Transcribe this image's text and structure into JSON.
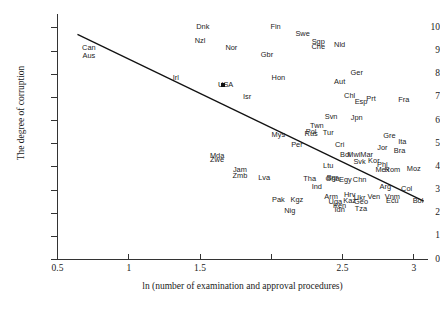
{
  "chart_data": {
    "type": "scatter",
    "title": "",
    "xlabel": "ln (number of examination and approval procedures)",
    "ylabel": "The degree of corruption",
    "xlim": [
      0.5,
      3.1
    ],
    "ylim": [
      0,
      10.6
    ],
    "xticks": [
      0.5,
      1,
      1.5,
      2,
      2.5,
      3
    ],
    "xticklabels": [
      "0.5",
      "1",
      "1.5",
      "",
      "2.5",
      "3"
    ],
    "yticks": [
      0,
      1,
      2,
      3,
      4,
      5,
      6,
      7,
      8,
      9,
      10
    ],
    "yticklabels": [
      "0",
      "1",
      "2",
      "3",
      "4",
      "5",
      "6",
      "7",
      "8",
      "9",
      "10"
    ],
    "grid": false,
    "legend": false,
    "trendline": {
      "x0": 0.64,
      "y0": 9.72,
      "x1": 3.07,
      "y1": 2.52
    },
    "points": [
      {
        "label": "Can",
        "x": 0.72,
        "y": 9.15
      },
      {
        "label": "Aus",
        "x": 0.72,
        "y": 8.78
      },
      {
        "label": "Dnk",
        "x": 1.52,
        "y": 10.02
      },
      {
        "label": "Nzl",
        "x": 1.5,
        "y": 9.45
      },
      {
        "label": "Fin",
        "x": 2.03,
        "y": 10.05
      },
      {
        "label": "Swe",
        "x": 2.22,
        "y": 9.72
      },
      {
        "label": "Nor",
        "x": 1.72,
        "y": 9.12
      },
      {
        "label": "Gbr",
        "x": 1.97,
        "y": 8.85
      },
      {
        "label": "Sgp",
        "x": 2.33,
        "y": 9.38
      },
      {
        "label": "Che",
        "x": 2.33,
        "y": 9.18
      },
      {
        "label": "Nld",
        "x": 2.48,
        "y": 9.28
      },
      {
        "label": "Irl",
        "x": 1.33,
        "y": 7.83
      },
      {
        "label": "USA",
        "x": 1.68,
        "y": 7.55
      },
      {
        "label": "Hon",
        "x": 2.05,
        "y": 7.85
      },
      {
        "label": "Ger",
        "x": 2.6,
        "y": 8.05
      },
      {
        "label": "Aut",
        "x": 2.48,
        "y": 7.65
      },
      {
        "label": "Isr",
        "x": 1.83,
        "y": 7.02
      },
      {
        "label": "Chl",
        "x": 2.55,
        "y": 7.05
      },
      {
        "label": "Esp",
        "x": 2.63,
        "y": 6.82
      },
      {
        "label": "Prt",
        "x": 2.7,
        "y": 6.92
      },
      {
        "label": "Fra",
        "x": 2.93,
        "y": 6.88
      },
      {
        "label": "Svn",
        "x": 2.42,
        "y": 6.15
      },
      {
        "label": "Jpn",
        "x": 2.6,
        "y": 6.12
      },
      {
        "label": "Twn",
        "x": 2.32,
        "y": 5.78
      },
      {
        "label": "Pol",
        "x": 2.28,
        "y": 5.52
      },
      {
        "label": "Rus",
        "x": 2.28,
        "y": 5.42
      },
      {
        "label": "Tur",
        "x": 2.4,
        "y": 5.48
      },
      {
        "label": "Mys",
        "x": 2.05,
        "y": 5.38
      },
      {
        "label": "Gre",
        "x": 2.83,
        "y": 5.32
      },
      {
        "label": "Ita",
        "x": 2.92,
        "y": 5.08
      },
      {
        "label": "Per",
        "x": 2.18,
        "y": 4.95
      },
      {
        "label": "Cri",
        "x": 2.48,
        "y": 4.95
      },
      {
        "label": "Jor",
        "x": 2.78,
        "y": 4.82
      },
      {
        "label": "Bra",
        "x": 2.9,
        "y": 4.68
      },
      {
        "label": "Mda",
        "x": 1.62,
        "y": 4.48
      },
      {
        "label": "Zwe",
        "x": 1.62,
        "y": 4.3
      },
      {
        "label": "Mwi",
        "x": 2.58,
        "y": 4.52
      },
      {
        "label": "Mar",
        "x": 2.67,
        "y": 4.52
      },
      {
        "label": "Bol",
        "x": 2.52,
        "y": 4.52
      },
      {
        "label": "Svk",
        "x": 2.62,
        "y": 4.22
      },
      {
        "label": "Kor",
        "x": 2.72,
        "y": 4.25
      },
      {
        "label": "Phl",
        "x": 2.78,
        "y": 4.08
      },
      {
        "label": "Ltu",
        "x": 2.4,
        "y": 4.05
      },
      {
        "label": "Jam",
        "x": 1.78,
        "y": 3.85
      },
      {
        "label": "Zmb",
        "x": 1.78,
        "y": 3.62
      },
      {
        "label": "Lva",
        "x": 1.95,
        "y": 3.52
      },
      {
        "label": "Tha",
        "x": 2.27,
        "y": 3.48
      },
      {
        "label": "Bgr",
        "x": 2.43,
        "y": 3.5
      },
      {
        "label": "Gha",
        "x": 2.43,
        "y": 3.48
      },
      {
        "label": "Egy",
        "x": 2.52,
        "y": 3.45
      },
      {
        "label": "Chn",
        "x": 2.62,
        "y": 3.42
      },
      {
        "label": "Mex",
        "x": 2.78,
        "y": 3.88
      },
      {
        "label": "Rom",
        "x": 2.85,
        "y": 3.88
      },
      {
        "label": "Moz",
        "x": 3.0,
        "y": 3.92
      },
      {
        "label": "Ind",
        "x": 2.32,
        "y": 3.15
      },
      {
        "label": "Arg",
        "x": 2.8,
        "y": 3.12
      },
      {
        "label": "Col",
        "x": 2.95,
        "y": 3.05
      },
      {
        "label": "Pak",
        "x": 2.05,
        "y": 2.55
      },
      {
        "label": "Kgz",
        "x": 2.18,
        "y": 2.55
      },
      {
        "label": "Arm",
        "x": 2.42,
        "y": 2.72
      },
      {
        "label": "Hrv",
        "x": 2.55,
        "y": 2.78
      },
      {
        "label": "Ukr",
        "x": 2.62,
        "y": 2.65
      },
      {
        "label": "Ven",
        "x": 2.72,
        "y": 2.68
      },
      {
        "label": "Vnm",
        "x": 2.85,
        "y": 2.7
      },
      {
        "label": "Ecu",
        "x": 2.85,
        "y": 2.52
      },
      {
        "label": "Bol",
        "x": 3.03,
        "y": 2.52
      },
      {
        "label": "Uga",
        "x": 2.45,
        "y": 2.48
      },
      {
        "label": "Kaz",
        "x": 2.55,
        "y": 2.52
      },
      {
        "label": "Geo",
        "x": 2.63,
        "y": 2.48
      },
      {
        "label": "Ken",
        "x": 2.48,
        "y": 2.32
      },
      {
        "label": "Idn",
        "x": 2.48,
        "y": 2.12
      },
      {
        "label": "Tza",
        "x": 2.63,
        "y": 2.2
      },
      {
        "label": "Nig",
        "x": 2.13,
        "y": 2.08
      }
    ],
    "markers": [
      {
        "label": "USA",
        "x": 1.66,
        "y": 7.52
      }
    ]
  }
}
